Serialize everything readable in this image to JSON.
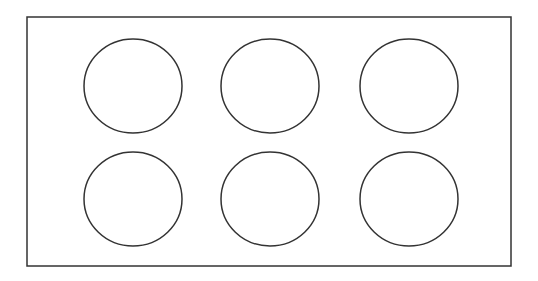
{
  "diagram": {
    "stroke_color": "#333333",
    "background": "#ffffff",
    "frame": {
      "x": 27,
      "y": 17,
      "width": 484,
      "height": 249
    },
    "grid": {
      "rows": 2,
      "cols": 3
    },
    "circles": [
      {
        "cx": 133,
        "cy": 86,
        "rx": 49,
        "ry": 47
      },
      {
        "cx": 270,
        "cy": 86,
        "rx": 49,
        "ry": 47
      },
      {
        "cx": 409,
        "cy": 86,
        "rx": 49,
        "ry": 47
      },
      {
        "cx": 133,
        "cy": 199,
        "rx": 49,
        "ry": 47
      },
      {
        "cx": 270,
        "cy": 199,
        "rx": 49,
        "ry": 47
      },
      {
        "cx": 409,
        "cy": 199,
        "rx": 49,
        "ry": 47
      }
    ]
  }
}
